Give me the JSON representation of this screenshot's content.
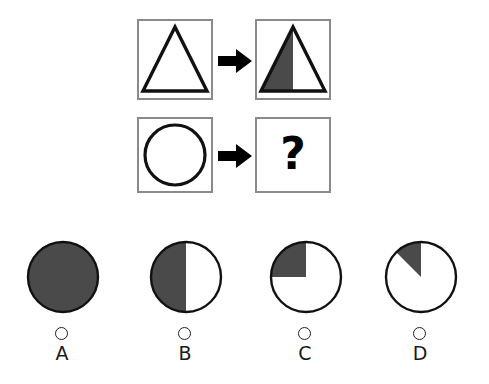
{
  "puzzle": {
    "type": "visual-analogy-matrix",
    "question_mark": "?",
    "colors": {
      "shade": "#4a4a4a",
      "outline": "#111111",
      "panel_border": "#8a8a8a",
      "background": "#ffffff",
      "radio_border": "#222222"
    },
    "matrix": {
      "rows": [
        {
          "name": "row-triangle",
          "source": {
            "shape": "triangle",
            "fill": "none",
            "description": "unshaded outline triangle"
          },
          "operator": "arrow-right",
          "target": {
            "shape": "triangle",
            "fill": "half",
            "shaded_part": "left-half",
            "shaded_fraction": "1/2",
            "description": "triangle with left half shaded"
          }
        },
        {
          "name": "row-circle",
          "source": {
            "shape": "circle",
            "fill": "none",
            "description": "unshaded outline circle"
          },
          "operator": "arrow-right",
          "target": {
            "shape": "unknown",
            "fill": "unknown",
            "description": "question mark placeholder"
          }
        }
      ]
    },
    "options": [
      {
        "letter": "A",
        "shape": "circle",
        "fill": "full",
        "shaded_fraction": "1/1",
        "shaded_part": "whole",
        "selected": false
      },
      {
        "letter": "B",
        "shape": "circle",
        "fill": "half",
        "shaded_fraction": "1/2",
        "shaded_part": "left-half",
        "selected": false
      },
      {
        "letter": "C",
        "shape": "circle",
        "fill": "quarter",
        "shaded_fraction": "1/4",
        "shaded_part": "upper-left-quadrant",
        "selected": false
      },
      {
        "letter": "D",
        "shape": "circle",
        "fill": "eighth",
        "shaded_fraction": "1/8",
        "shaded_part": "upper-left-wedge",
        "selected": false
      }
    ]
  }
}
